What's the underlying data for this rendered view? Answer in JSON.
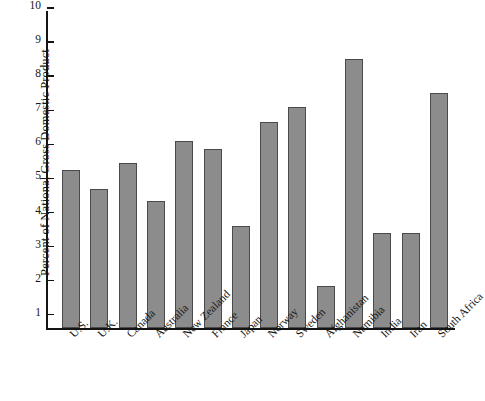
{
  "chart_data": {
    "type": "bar",
    "title": "",
    "subtitle": "",
    "xlabel": "",
    "ylabel": "Percent of National Gross Domestic Product",
    "categories": [
      "U.S.",
      "U.K.",
      "Canada",
      "Australia",
      "New Zealand",
      "France",
      "Japan",
      "Norway",
      "Sweden",
      "Afghanistan",
      "Namibia",
      "India",
      "Iran",
      "South Africa"
    ],
    "values": [
      5.25,
      4.7,
      5.45,
      4.35,
      6.1,
      5.85,
      3.6,
      6.65,
      7.1,
      1.85,
      8.5,
      3.4,
      3.4,
      7.5
    ],
    "ylim": [
      0.6,
      10
    ],
    "yticks": [
      1,
      2,
      3,
      4,
      5,
      6,
      7,
      8,
      9,
      10
    ],
    "ytick_labels": [
      "1",
      "2",
      "3",
      "4",
      "5",
      "6",
      "7",
      "8",
      "9",
      "10"
    ],
    "grid": false,
    "legend": null,
    "bar_color": "#8c8c8c",
    "bar_edge_color": "#4a4a4a",
    "axis_color": "#141414",
    "background": "#ffffff",
    "annotations": []
  }
}
